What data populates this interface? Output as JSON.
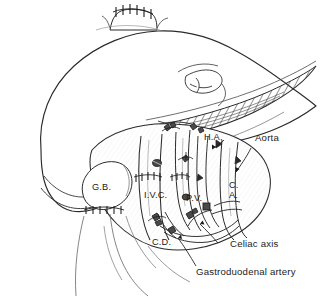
{
  "figure": {
    "kind": "surgical-line-drawing",
    "background_color": "#ffffff",
    "ink_color": "#1b1b1b"
  },
  "labels": {
    "hepatic_artery": "H.A.",
    "aorta": "Aorta",
    "gallbladder": "G.B.",
    "inferior_vena_cava": "I.V.C.",
    "portal_vein": "P.V.",
    "celiac_axis_abbrev_line1": "C.",
    "celiac_axis_abbrev_line2": "A.",
    "common_duct": "C.D.",
    "celiac_axis": "Celiac axis",
    "gastroduodenal_artery": "Gastroduodenal artery"
  }
}
